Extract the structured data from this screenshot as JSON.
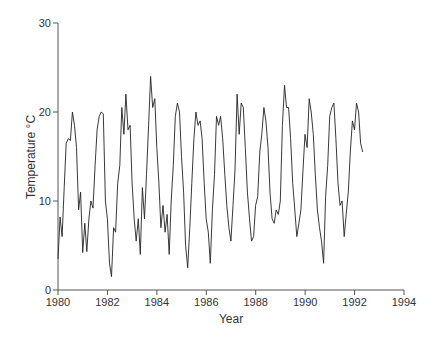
{
  "chart_data": {
    "type": "line",
    "title": "",
    "xlabel": "Year",
    "ylabel": "Temperature °C",
    "xlim": [
      1980,
      1994
    ],
    "ylim": [
      0,
      30
    ],
    "x_ticks": [
      "1980",
      "1982",
      "1984",
      "1986",
      "1988",
      "1990",
      "1992",
      "1994"
    ],
    "y_ticks": [
      "0",
      "10",
      "20",
      "30"
    ],
    "grid": false,
    "legend": null,
    "series": [
      {
        "name": "Temperature",
        "color": "#222222",
        "x_start": 1980.0,
        "x_step": 0.0833,
        "values": [
          3.5,
          8.2,
          6.0,
          11.5,
          16.5,
          17.0,
          16.8,
          20.0,
          18.5,
          16.0,
          9.0,
          11.0,
          4.2,
          7.5,
          4.3,
          8.0,
          10.0,
          9.2,
          14.0,
          18.0,
          19.5,
          20.0,
          19.8,
          10.0,
          8.0,
          3.0,
          1.5,
          7.0,
          6.5,
          12.0,
          14.0,
          20.5,
          17.5,
          22.0,
          18.0,
          18.5,
          12.0,
          8.0,
          5.5,
          8.0,
          4.0,
          11.5,
          8.0,
          13.0,
          18.5,
          24.0,
          20.5,
          21.5,
          16.0,
          12.0,
          7.0,
          9.5,
          6.5,
          8.5,
          4.0,
          10.0,
          14.0,
          19.5,
          21.0,
          20.0,
          15.0,
          11.0,
          5.0,
          2.5,
          7.0,
          12.0,
          17.0,
          20.0,
          18.5,
          19.0,
          17.0,
          12.0,
          8.0,
          6.5,
          3.0,
          9.0,
          13.0,
          19.5,
          18.5,
          19.5,
          17.0,
          13.0,
          9.5,
          7.0,
          5.5,
          9.5,
          13.5,
          22.0,
          17.5,
          21.0,
          20.5,
          16.0,
          11.0,
          8.0,
          5.5,
          6.0,
          9.5,
          10.5,
          15.5,
          17.5,
          20.5,
          19.0,
          16.0,
          11.0,
          8.0,
          7.5,
          9.0,
          8.5,
          10.0,
          18.5,
          23.0,
          20.5,
          20.5,
          17.0,
          12.0,
          9.0,
          6.0,
          7.5,
          9.0,
          13.5,
          17.5,
          16.0,
          21.5,
          20.0,
          17.5,
          13.0,
          9.0,
          7.0,
          5.5,
          3.0,
          10.5,
          14.0,
          19.5,
          20.5,
          21.0,
          17.0,
          12.0,
          9.5,
          10.0,
          6.0,
          8.5,
          11.0,
          15.5,
          19.0,
          18.0,
          21.0,
          20.0,
          16.5,
          15.5
        ]
      }
    ]
  }
}
